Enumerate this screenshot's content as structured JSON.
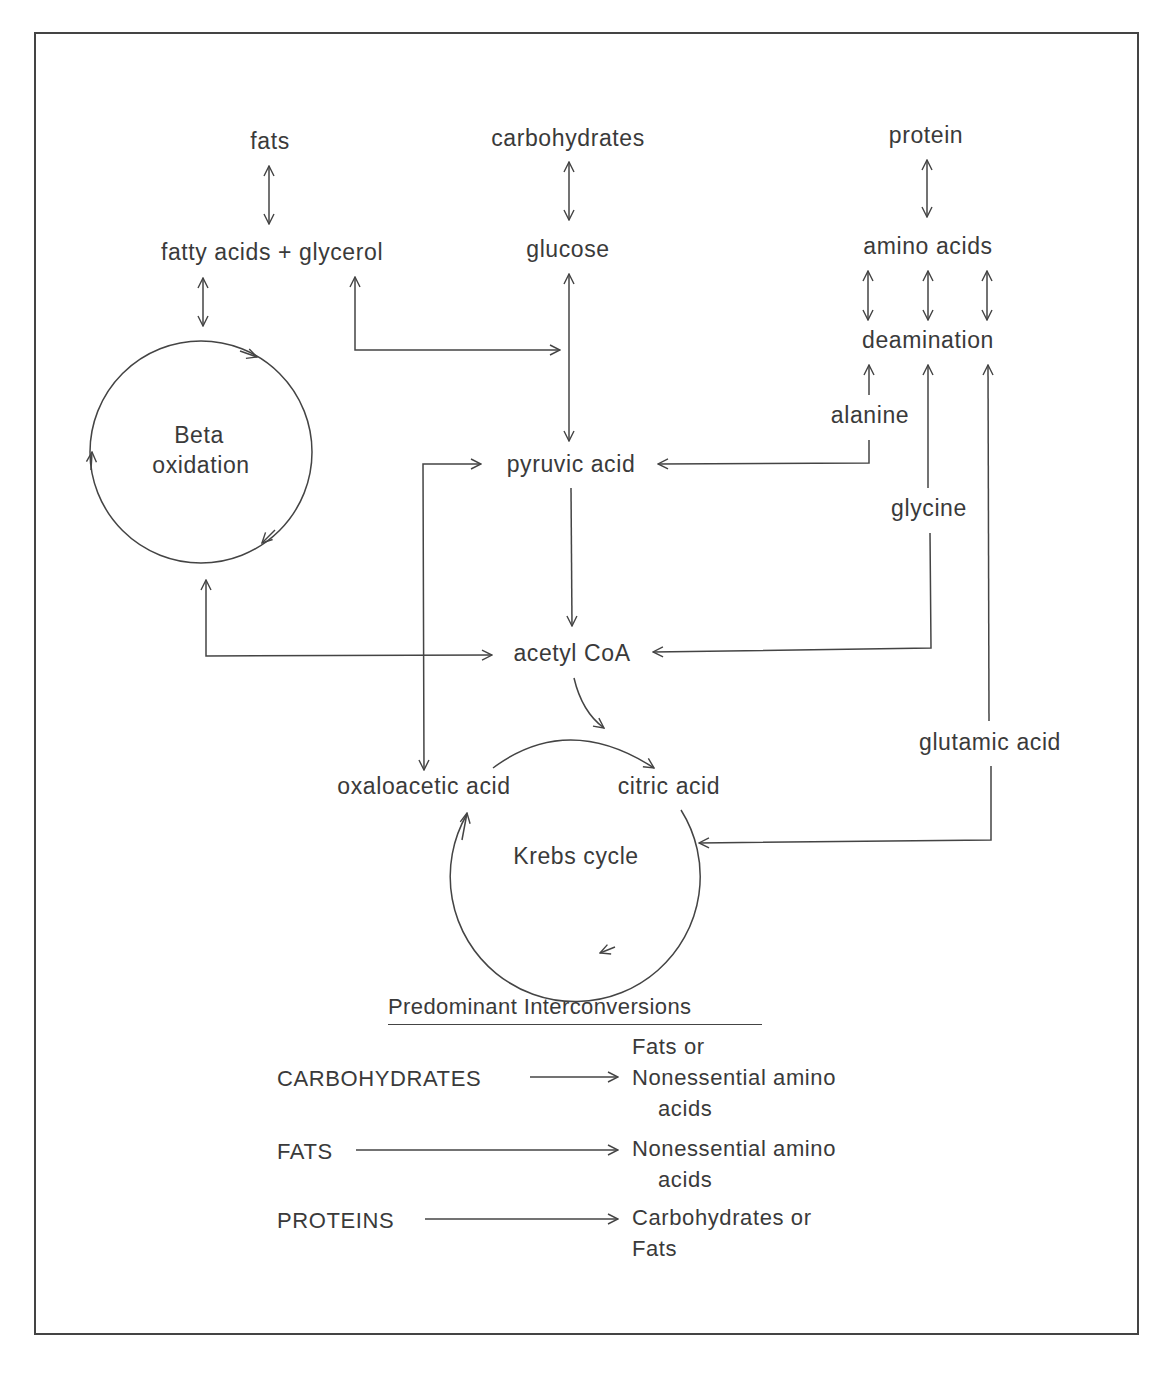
{
  "diagram": {
    "nodes": {
      "fats": "fats",
      "carbohydrates": "carbohydrates",
      "protein": "protein",
      "fatty_acids_glycerol": "fatty acids + glycerol",
      "glucose": "glucose",
      "amino_acids": "amino acids",
      "deamination": "deamination",
      "alanine": "alanine",
      "beta_oxidation_line1": "Beta",
      "beta_oxidation_line2": "oxidation",
      "pyruvic_acid": "pyruvic acid",
      "glycine": "glycine",
      "acetyl_coa": "acetyl CoA",
      "glutamic_acid": "glutamic acid",
      "oxaloacetic_acid": "oxaloacetic acid",
      "citric_acid": "citric acid",
      "krebs_cycle": "Krebs cycle"
    },
    "edges": [
      {
        "from": "fats",
        "to": "fatty acids + glycerol",
        "type": "bidirectional"
      },
      {
        "from": "carbohydrates",
        "to": "glucose",
        "type": "bidirectional"
      },
      {
        "from": "protein",
        "to": "amino acids",
        "type": "bidirectional"
      },
      {
        "from": "fatty acids",
        "to": "Beta oxidation",
        "type": "bidirectional"
      },
      {
        "from": "glycerol",
        "to": "glucose-pyruvic path",
        "type": "bidirectional"
      },
      {
        "from": "glucose",
        "to": "pyruvic acid",
        "type": "bidirectional"
      },
      {
        "from": "amino acids",
        "to": "deamination",
        "type": "bidirectional",
        "count": 3
      },
      {
        "from": "alanine",
        "to": "deamination",
        "type": "directed"
      },
      {
        "from": "alanine",
        "to": "pyruvic acid",
        "type": "directed"
      },
      {
        "from": "glycine",
        "to": "deamination",
        "type": "directed"
      },
      {
        "from": "glycine",
        "to": "acetyl CoA",
        "type": "directed"
      },
      {
        "from": "glutamic acid",
        "to": "deamination",
        "type": "directed"
      },
      {
        "from": "glutamic acid",
        "to": "Krebs cycle",
        "type": "directed"
      },
      {
        "from": "pyruvic acid",
        "to": "acetyl CoA",
        "type": "directed"
      },
      {
        "from": "Beta oxidation",
        "to": "acetyl CoA",
        "type": "bidirectional"
      },
      {
        "from": "pyruvic acid",
        "to": "oxaloacetic acid",
        "type": "bidirectional"
      },
      {
        "from": "acetyl CoA",
        "to": "citric acid",
        "type": "directed"
      },
      {
        "from": "oxaloacetic acid",
        "to": "citric acid",
        "type": "directed"
      }
    ]
  },
  "legend": {
    "title": "Predominant Interconversions",
    "rows": [
      {
        "source": "CARBOHYDRATES",
        "target_lines": [
          "Fats or",
          "Nonessential amino",
          "acids"
        ]
      },
      {
        "source": "FATS",
        "target_lines": [
          "Nonessential amino",
          "acids"
        ]
      },
      {
        "source": "PROTEINS",
        "target_lines": [
          "Carbohydrates or",
          "Fats"
        ]
      }
    ]
  }
}
